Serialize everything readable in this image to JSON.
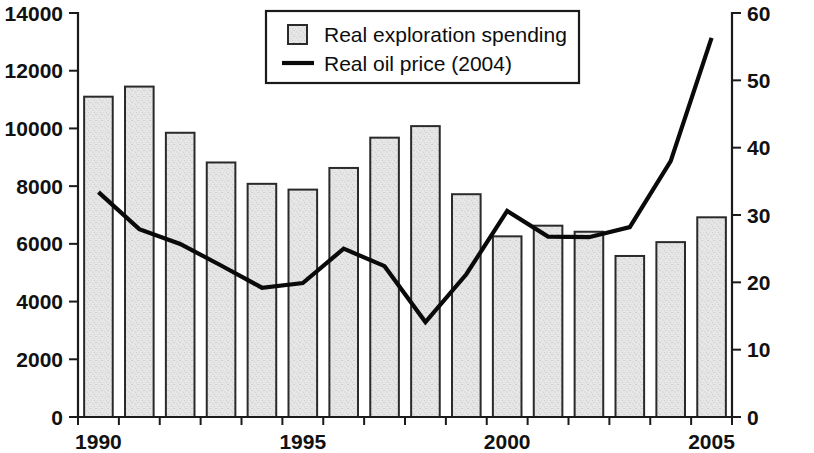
{
  "chart_data": {
    "type": "bar",
    "title": "",
    "subtitle": "",
    "xlabel": "",
    "ylabel": "",
    "y2label": "",
    "grid": false,
    "legend_position": "top-center",
    "x": [
      1990,
      1991,
      1992,
      1993,
      1994,
      1995,
      1996,
      1997,
      1998,
      1999,
      2000,
      2001,
      2002,
      2003,
      2004,
      2005
    ],
    "categories": [
      "1990",
      "1991",
      "1992",
      "1993",
      "1994",
      "1995",
      "1996",
      "1997",
      "1998",
      "1999",
      "2000",
      "2001",
      "2002",
      "2003",
      "2004",
      "2005"
    ],
    "x_tick_labels": [
      "1990",
      "1995",
      "2000",
      "2005"
    ],
    "x_tick_values": [
      1990,
      1995,
      2000,
      2005
    ],
    "xlim": [
      1989.5,
      2005.5
    ],
    "ylim": [
      0,
      14000
    ],
    "y_tick_labels": [
      "0",
      "2000",
      "4000",
      "6000",
      "8000",
      "10000",
      "12000",
      "14000"
    ],
    "y_tick_values": [
      0,
      2000,
      4000,
      6000,
      8000,
      10000,
      12000,
      14000
    ],
    "y2lim": [
      0,
      60
    ],
    "y2_tick_labels": [
      "0",
      "10",
      "20",
      "30",
      "40",
      "50",
      "60"
    ],
    "y2_tick_values": [
      0,
      10,
      20,
      30,
      40,
      50,
      60
    ],
    "series": [
      {
        "name": "Real exploration spending",
        "type": "bar",
        "axis": "left",
        "color": "#e3e3e3",
        "edge_color": "#2a2a2a",
        "values": [
          11100,
          11450,
          9850,
          8820,
          8080,
          7880,
          8630,
          9680,
          10080,
          7720,
          6260,
          6630,
          6420,
          5580,
          6060,
          6920
        ]
      },
      {
        "name": "Real oil price (2004)",
        "type": "line",
        "axis": "right",
        "color": "#0a0a0a",
        "values": [
          33.4,
          27.9,
          25.7,
          22.5,
          19.2,
          19.9,
          25.0,
          22.4,
          14.1,
          21.2,
          30.6,
          26.8,
          26.7,
          28.2,
          38.0,
          56.3
        ]
      }
    ],
    "legend": [
      {
        "label": "Real exploration spending",
        "marker": "square-swatch",
        "color": "#e3e3e3"
      },
      {
        "label": "Real oil price (2004)",
        "marker": "line-swatch",
        "color": "#0a0a0a"
      }
    ]
  }
}
